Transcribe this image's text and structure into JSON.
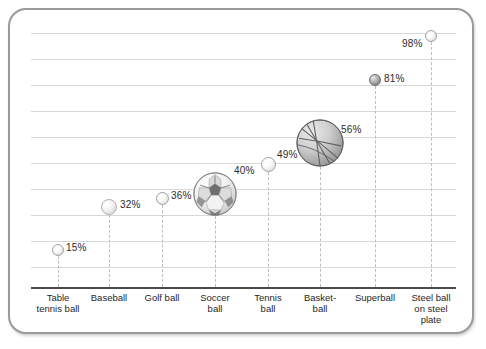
{
  "chart_data": {
    "type": "scatter",
    "title": "",
    "subtitle": "",
    "xlabel": "",
    "ylabel": "",
    "grid": true,
    "legend": "none",
    "axis_ranges": {
      "y_min_percent": 0,
      "y_max_percent": 100
    },
    "categories": [
      "Table\ntennis ball",
      "Baseball",
      "Golf ball",
      "Soccer\nball",
      "Tennis\nball",
      "Basket-\nball",
      "Superball",
      "Steel ball\non steel\nplate"
    ],
    "values": [
      15,
      32,
      36,
      40,
      49,
      56,
      81,
      98
    ],
    "value_labels": [
      "15%",
      "32%",
      "36%",
      "40%",
      "49%",
      "56%",
      "81%",
      "98%"
    ],
    "marker_kinds": [
      "plain-sphere",
      "textured-sphere",
      "plain-sphere",
      "soccer-ball",
      "plain-sphere",
      "basketball",
      "dark-sphere",
      "plain-sphere"
    ],
    "marker_sizes_px": [
      12,
      16,
      13,
      44,
      14,
      48,
      12,
      12
    ],
    "gridline_count": 10,
    "colors": {
      "frame_border": "#9a9a9a",
      "gridline": "#d8d8d8",
      "axis": "#4a4a4a",
      "stem": "#bdbdbd",
      "label_text": "#2b2b2b",
      "category_text": "#1f1f1f",
      "background": "#ffffff"
    }
  },
  "points": [
    {
      "name": "table-tennis-ball",
      "label": "15%",
      "value": 15,
      "cx": 58,
      "cy": 250,
      "d": 12,
      "kind": "plain-sphere",
      "lx": 66,
      "ly": 242
    },
    {
      "name": "baseball",
      "label": "32%",
      "value": 32,
      "cx": 109,
      "cy": 207,
      "d": 16,
      "kind": "textured-sphere",
      "lx": 120,
      "ly": 199
    },
    {
      "name": "golf-ball",
      "label": "36%",
      "value": 36,
      "cx": 162,
      "cy": 198,
      "d": 13,
      "kind": "plain-sphere",
      "lx": 171,
      "ly": 190
    },
    {
      "name": "soccer-ball",
      "label": "40%",
      "value": 40,
      "cx": 215,
      "cy": 194,
      "d": 44,
      "kind": "soccer-ball",
      "lx": 234,
      "ly": 165
    },
    {
      "name": "tennis-ball",
      "label": "49%",
      "value": 49,
      "cx": 268,
      "cy": 164,
      "d": 15,
      "kind": "plain-sphere",
      "lx": 277,
      "ly": 149
    },
    {
      "name": "basketball",
      "label": "56%",
      "value": 56,
      "cx": 320,
      "cy": 143,
      "d": 48,
      "kind": "basketball",
      "lx": 341,
      "ly": 124
    },
    {
      "name": "superball",
      "label": "81%",
      "value": 81,
      "cx": 375,
      "cy": 80,
      "d": 12,
      "kind": "dark-sphere",
      "lx": 384,
      "ly": 73
    },
    {
      "name": "steel-ball",
      "label": "98%",
      "value": 98,
      "cx": 431,
      "cy": 36,
      "d": 12,
      "kind": "plain-sphere",
      "lx": 402,
      "ly": 38
    }
  ],
  "category_labels": [
    {
      "name": "cat-table-tennis-ball",
      "text": "Table\ntennis ball",
      "cx": 58
    },
    {
      "name": "cat-baseball",
      "text": "Baseball",
      "cx": 109
    },
    {
      "name": "cat-golf-ball",
      "text": "Golf ball",
      "cx": 162
    },
    {
      "name": "cat-soccer-ball",
      "text": "Soccer\nball",
      "cx": 215
    },
    {
      "name": "cat-tennis-ball",
      "text": "Tennis\nball",
      "cx": 268
    },
    {
      "name": "cat-basketball",
      "text": "Basket-\nball",
      "cx": 320
    },
    {
      "name": "cat-superball",
      "text": "Superball",
      "cx": 375
    },
    {
      "name": "cat-steel-ball",
      "text": "Steel ball\non steel\nplate",
      "cx": 431
    }
  ],
  "gridlines_y": [
    33,
    59,
    85,
    111,
    137,
    163,
    189,
    215,
    241,
    267
  ]
}
